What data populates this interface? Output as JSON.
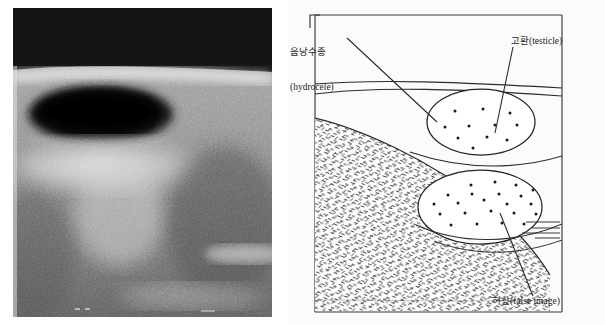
{
  "figure": {
    "panels": [
      {
        "name": "ultrasound-photograph",
        "kind": "grayscale-sonogram"
      },
      {
        "name": "schematic-diagram",
        "kind": "line-drawing"
      }
    ]
  },
  "labels": {
    "hydrocele": {
      "korean": "음낭수종",
      "english": "(hydrocele)",
      "leader_from": [
        347,
        38
      ],
      "leader_to": [
        437,
        122
      ]
    },
    "testicle": {
      "text": "고환(testicle)",
      "korean": "고환",
      "english": "(testicle)",
      "leader_from": [
        513,
        47
      ],
      "leader_to": [
        495,
        133
      ]
    },
    "false_image": {
      "text": "허상(false image)",
      "korean": "허상",
      "english": "(false image)",
      "leader_from": [
        533,
        296
      ],
      "leader_to": [
        500,
        213
      ]
    }
  },
  "diagram": {
    "frame": {
      "x": 27,
      "y": 15,
      "w": 247,
      "h": 297
    },
    "skin_lines": 2,
    "regions": [
      {
        "name": "hydrocele-fluid",
        "fill": "white"
      },
      {
        "name": "stippled-wedge",
        "fill": "speckle-texture"
      },
      {
        "name": "upper-testicle-ellipse",
        "dots": 10
      },
      {
        "name": "lower-false-image-ellipse",
        "dots": 20
      }
    ],
    "reverberation_lines": 4
  },
  "colors": {
    "ink": "#1d1d1d",
    "paper": "#ffffff",
    "panel_background": "#f8f8f8",
    "sonogram_dark": "#111111",
    "speckle": "#5a5a5a"
  }
}
